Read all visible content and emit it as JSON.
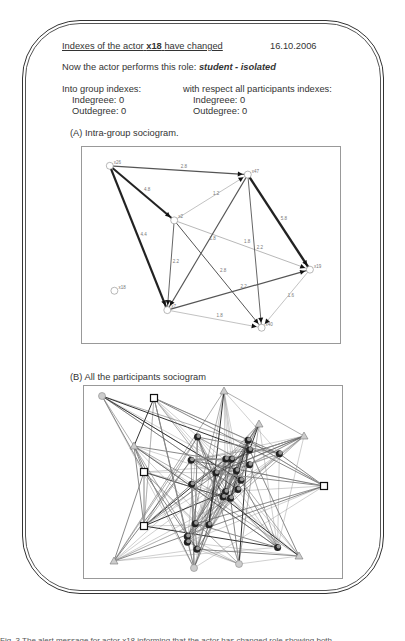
{
  "header": {
    "title_prefix": "Indexes of the actor",
    "actor": "x18",
    "title_suffix": "have changed",
    "date": "16.10.2006"
  },
  "role": {
    "label": "Now the actor performs this role:",
    "value": "student - isolated"
  },
  "group_indexes": {
    "heading": "Into group indexes:",
    "indegree": "Indegreee: 0",
    "outdegree": "Outdegree: 0"
  },
  "all_indexes": {
    "heading": "with respect all participants indexes:",
    "indegree": "Indegreee: 0",
    "outdegree": "Outdegree: 0"
  },
  "sociogram_a": {
    "title": "(A) Intra-group sociogram.",
    "nodes": [
      {
        "id": "x26",
        "x": 0.06,
        "y": 0.05
      },
      {
        "id": "x47",
        "x": 0.66,
        "y": 0.1
      },
      {
        "id": "x2",
        "x": 0.34,
        "y": 0.36
      },
      {
        "id": "x19",
        "x": 0.93,
        "y": 0.64
      },
      {
        "id": "x18",
        "x": 0.08,
        "y": 0.76
      },
      {
        "id": "x7",
        "x": 0.31,
        "y": 0.87
      },
      {
        "id": "x40",
        "x": 0.72,
        "y": 0.97
      }
    ],
    "edges": [
      {
        "from": "x26",
        "to": "x47",
        "label": "2.8",
        "w": 1.2
      },
      {
        "from": "x26",
        "to": "x2",
        "label": "4.8",
        "w": 2
      },
      {
        "from": "x26",
        "to": "x7",
        "label": "4.4",
        "w": 2.2
      },
      {
        "from": "x2",
        "to": "x47",
        "label": "1.2",
        "w": 0.6
      },
      {
        "from": "x2",
        "to": "x19",
        "label": "1.8",
        "w": 0.7
      },
      {
        "from": "x2",
        "to": "x7",
        "label": "2.2",
        "w": 0.9
      },
      {
        "from": "x2",
        "to": "x40",
        "label": "2.8",
        "w": 1
      },
      {
        "from": "x47",
        "to": "x7",
        "label": "1.8",
        "w": 1.1
      },
      {
        "from": "x47",
        "to": "x40",
        "label": "2.2",
        "w": 0.9
      },
      {
        "from": "x47",
        "to": "x19",
        "label": "5.8",
        "w": 2.4
      },
      {
        "from": "x7",
        "to": "x19",
        "label": "2.2",
        "w": 1.2
      },
      {
        "from": "x7",
        "to": "x40",
        "label": "1.8",
        "w": 0.6
      },
      {
        "from": "x19",
        "to": "x40",
        "label": "1.6",
        "w": 0.6
      }
    ]
  },
  "sociogram_b": {
    "title": "(B) All the participants sociogram"
  },
  "caption": "Fig. 3 The alert message for actor x18 informing that the actor has changed role showing both"
}
